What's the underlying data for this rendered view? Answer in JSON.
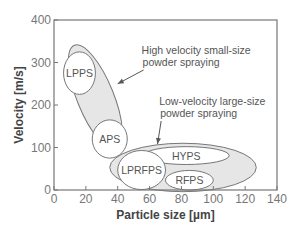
{
  "chart_data": {
    "type": "scatter",
    "subtype": "region-ellipses",
    "title": "",
    "xlabel": "Particle size [µm]",
    "ylabel": "Velocity [m/s]",
    "xlim": [
      0,
      140
    ],
    "ylim": [
      0,
      400
    ],
    "xticks": [
      0,
      20,
      40,
      60,
      80,
      100,
      120,
      140
    ],
    "yticks": [
      0,
      100,
      200,
      300,
      400
    ],
    "grid": false,
    "colors": {
      "axis": "#777777",
      "outline": "#777777",
      "fill_group": "#e6e6e6",
      "fill_inner": "#ffffff"
    },
    "groups": [
      {
        "name": "High velocity small-size powder spraying",
        "annotation_lines": [
          "High velocity small-size",
          "powder spraying"
        ],
        "region": {
          "cx": 26,
          "cy": 218,
          "rx": 11.5,
          "ry": 132,
          "tilt_deg": -22
        },
        "annotation_anchor": {
          "x": 55,
          "y": 320
        },
        "arrow_to": {
          "x": 40,
          "y": 250
        },
        "members": [
          {
            "name": "LPPS",
            "cx": 16,
            "cy": 275,
            "rx": 10,
            "ry": 50
          },
          {
            "name": "APS",
            "cx": 35,
            "cy": 120,
            "rx": 11,
            "ry": 45
          }
        ]
      },
      {
        "name": "Low-velocity large-size powder spraying",
        "annotation_lines": [
          "Low-velocity large-size",
          "powder spraying"
        ],
        "region": {
          "cx": 81,
          "cy": 53,
          "rx": 46,
          "ry": 57,
          "tilt_deg": 0
        },
        "annotation_anchor": {
          "x": 66,
          "y": 200
        },
        "arrow_to": {
          "x": 65,
          "y": 108
        },
        "members": [
          {
            "name": "HYPS",
            "cx": 83,
            "cy": 81,
            "rx": 27,
            "ry": 21
          },
          {
            "name": "LPRFPS",
            "cx": 55,
            "cy": 47,
            "rx": 15,
            "ry": 46
          },
          {
            "name": "RFPS",
            "cx": 85,
            "cy": 23,
            "rx": 15,
            "ry": 23
          }
        ]
      }
    ]
  }
}
